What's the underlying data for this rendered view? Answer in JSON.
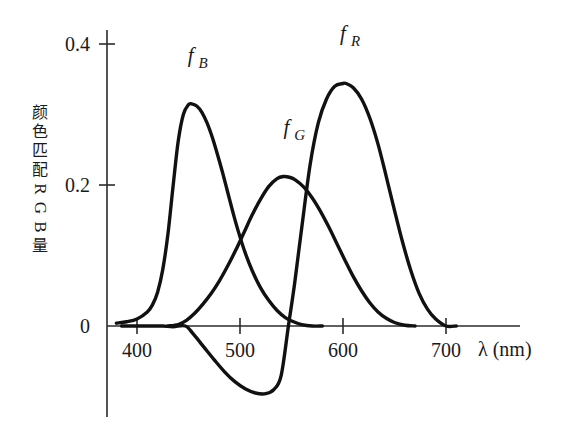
{
  "chart_data": {
    "type": "line",
    "title": "",
    "subtitle": "",
    "xlabel": "λ (nm)",
    "ylabel": "颜色匹配RGB量",
    "xlabel_symbol": "λ",
    "xlabel_unit": "(nm)",
    "ylabel_parts": [
      "颜",
      "色",
      "匹",
      "配",
      "R",
      "G",
      "B",
      "量"
    ],
    "xlim": [
      370,
      730
    ],
    "ylim": [
      -0.12,
      0.42
    ],
    "xticks": [
      400,
      500,
      600,
      700
    ],
    "xtick_labels": [
      "400",
      "500",
      "600",
      "700"
    ],
    "yticks": [
      0,
      0.2,
      0.4
    ],
    "ytick_labels": [
      "0",
      "0.2",
      "0.4"
    ],
    "grid": false,
    "legend_position": "inline-annotations",
    "line_color": "#111111",
    "axis_color": "#2b2b2b",
    "background_color": "#ffffff",
    "annotations": [
      {
        "name": "f_B",
        "base": "f",
        "sub": "B",
        "x": 452,
        "y": 0.375
      },
      {
        "name": "f_G",
        "base": "f",
        "sub": "G",
        "x": 545,
        "y": 0.272
      },
      {
        "name": "f_R",
        "base": "f",
        "sub": "R",
        "x": 600,
        "y": 0.405
      }
    ],
    "series": [
      {
        "name": "f_B",
        "label": "f_B",
        "peak_x": 453,
        "peak_y": 0.315,
        "x": [
          380,
          390,
          400,
          410,
          415,
          420,
          425,
          430,
          435,
          440,
          445,
          450,
          453,
          458,
          463,
          468,
          473,
          478,
          483,
          488,
          493,
          498,
          505,
          512,
          520,
          528,
          536,
          544,
          552,
          560,
          570,
          580
        ],
        "y": [
          0.004,
          0.006,
          0.01,
          0.02,
          0.03,
          0.048,
          0.08,
          0.13,
          0.198,
          0.262,
          0.3,
          0.314,
          0.315,
          0.312,
          0.303,
          0.288,
          0.268,
          0.244,
          0.218,
          0.19,
          0.162,
          0.136,
          0.104,
          0.078,
          0.054,
          0.036,
          0.022,
          0.012,
          0.006,
          0.002,
          0.0,
          0.0
        ]
      },
      {
        "name": "f_G",
        "label": "f_G",
        "peak_x": 545,
        "peak_y": 0.212,
        "x": [
          430,
          440,
          448,
          456,
          464,
          472,
          480,
          488,
          496,
          504,
          512,
          520,
          528,
          536,
          542,
          548,
          554,
          562,
          570,
          578,
          586,
          594,
          602,
          610,
          618,
          626,
          634,
          642,
          650,
          660,
          670
        ],
        "y": [
          0.0,
          0.002,
          0.008,
          0.018,
          0.031,
          0.046,
          0.064,
          0.085,
          0.108,
          0.133,
          0.158,
          0.18,
          0.198,
          0.209,
          0.212,
          0.211,
          0.207,
          0.197,
          0.182,
          0.163,
          0.141,
          0.117,
          0.093,
          0.07,
          0.05,
          0.033,
          0.02,
          0.011,
          0.005,
          0.001,
          0.0
        ]
      },
      {
        "name": "f_R",
        "label": "f_R",
        "peak_x": 603,
        "peak_y": 0.344,
        "negative_min_x": 525,
        "negative_min_y": -0.096,
        "zero_crossings": [
          447,
          547
        ],
        "x": [
          385,
          395,
          405,
          415,
          425,
          435,
          447,
          455,
          465,
          475,
          485,
          495,
          505,
          515,
          525,
          533,
          540,
          547,
          553,
          560,
          568,
          576,
          584,
          592,
          600,
          603,
          610,
          618,
          626,
          634,
          642,
          650,
          658,
          666,
          674,
          682,
          690,
          700,
          710
        ],
        "y": [
          0.0,
          0.0,
          0.0,
          0.0,
          0.0,
          -0.001,
          0.0,
          -0.012,
          -0.03,
          -0.048,
          -0.065,
          -0.079,
          -0.089,
          -0.095,
          -0.096,
          -0.09,
          -0.07,
          0.0,
          0.06,
          0.14,
          0.228,
          0.288,
          0.322,
          0.34,
          0.344,
          0.344,
          0.338,
          0.322,
          0.295,
          0.258,
          0.212,
          0.164,
          0.118,
          0.078,
          0.046,
          0.024,
          0.01,
          0.0,
          0.0
        ]
      }
    ]
  },
  "axes": {
    "y_axis_name": "vertical-axis",
    "x_axis_name": "horizontal-axis"
  }
}
